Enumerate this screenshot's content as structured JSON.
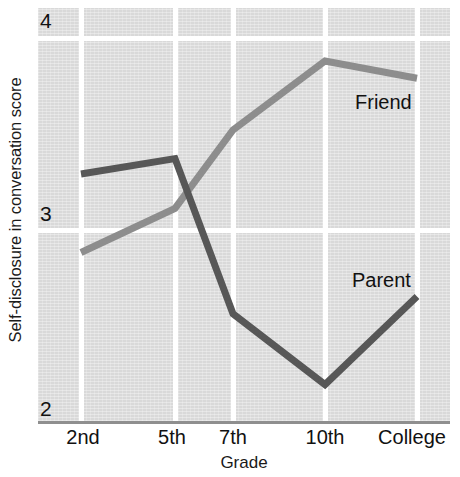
{
  "chart_data": {
    "type": "line",
    "title": "",
    "xlabel": "Grade",
    "ylabel": "Self-disclosure in conversation score",
    "categories": [
      "2nd",
      "5th",
      "7th",
      "10th",
      "College"
    ],
    "ylim": [
      2,
      4
    ],
    "yticks": [
      2,
      3,
      4
    ],
    "ytick_labels": [
      "2",
      "3",
      "4"
    ],
    "grid": true,
    "grid_color": "#ffffff",
    "plot_background": "#d9d9d9",
    "legend_position": "inline-annotations",
    "series": [
      {
        "name": "Friend",
        "color": "#8d8d8d",
        "values": [
          2.88,
          3.11,
          3.52,
          3.88,
          3.79
        ],
        "label_text": "Friend"
      },
      {
        "name": "Parent",
        "color": "#575757",
        "values": [
          3.29,
          3.37,
          2.56,
          2.19,
          2.65
        ],
        "label_text": "Parent"
      }
    ],
    "annotations": [
      {
        "text": "Friend",
        "series": "Friend",
        "x": 355,
        "y": 92
      },
      {
        "text": "Parent",
        "series": "Parent",
        "x": 352,
        "y": 270
      }
    ]
  },
  "axes": {
    "y_title": "Self-disclosure in conversation score",
    "x_title": "Grade",
    "y_tick_4": "4",
    "y_tick_3": "3",
    "y_tick_2": "2",
    "x_tick_0": "2nd",
    "x_tick_1": "5th",
    "x_tick_2": "7th",
    "x_tick_3": "10th",
    "x_tick_4": "College"
  },
  "labels": {
    "friend": "Friend",
    "parent": "Parent"
  }
}
